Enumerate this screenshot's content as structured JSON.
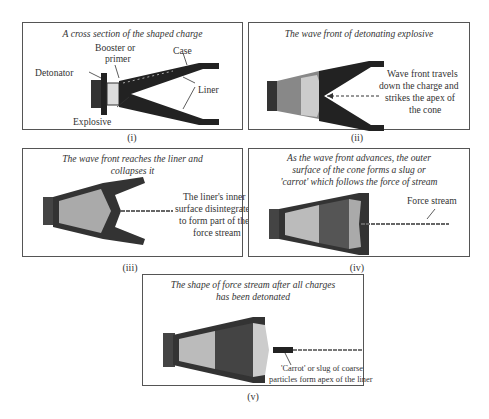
{
  "figure": {
    "panels": [
      {
        "id": "i",
        "label": "(i)",
        "title": "A cross section of the shaped charge",
        "annotations": {
          "booster": "Booster or",
          "booster2": "primer",
          "case": "Case",
          "detonator": "Detonator",
          "liner": "Liner",
          "explosive": "Explosive"
        }
      },
      {
        "id": "ii",
        "label": "(ii)",
        "title": "The wave front of detonating explosive",
        "annotations": {
          "l1": "Wave front travels",
          "l2": "down the charge and",
          "l3": "strikes the apex of",
          "l4": "the cone"
        }
      },
      {
        "id": "iii",
        "label": "(iii)",
        "title1": "The wave front reaches the liner and",
        "title2": "collapses it",
        "annotations": {
          "l1": "The liner's inner",
          "l2": "surface disintegrates",
          "l3": "to form part of the",
          "l4": "force stream"
        }
      },
      {
        "id": "iv",
        "label": "(iv)",
        "title1": "As the wave front advances, the outer",
        "title2": "surface of the cone forms a slug or",
        "title3": "'carrot' which follows the force of stream",
        "annotations": {
          "force": "Force stream"
        }
      },
      {
        "id": "v",
        "label": "(v)",
        "title1": "The shape of force stream after all charges",
        "title2": "has been detonated",
        "annotations": {
          "l1": "'Carrot' or slug of coarse",
          "l2": "particles form apex of the liner"
        }
      }
    ],
    "colors": {
      "case": "#222222",
      "explosive": "#d8d8d8",
      "border": "#555555"
    }
  }
}
